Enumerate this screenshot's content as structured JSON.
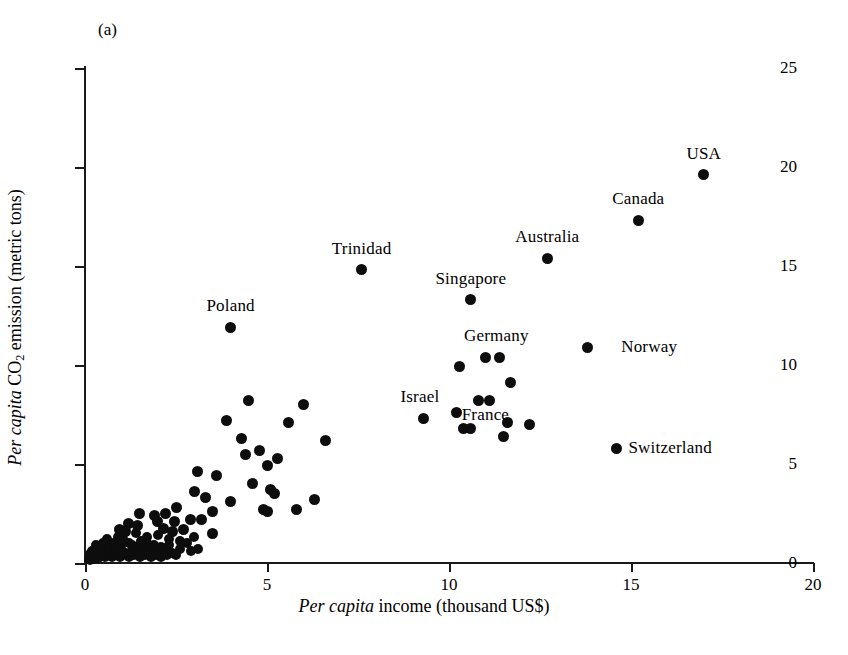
{
  "figure": {
    "panel_label": "(a)"
  },
  "chart_data": {
    "type": "scatter",
    "title": "",
    "panel": "(a)",
    "xlabel_parts": {
      "italic": "Per capita",
      "plain": " income (thousand US$)"
    },
    "ylabel_parts": {
      "italic": "Per capita",
      "plain_pre": " CO",
      "subscript": "2",
      "plain_post": " emission (metric tons)"
    },
    "xlabel": "Per capita income (thousand US$)",
    "ylabel": "Per capita CO2 emission (metric tons)",
    "xlim": [
      0,
      20
    ],
    "ylim": [
      0,
      25
    ],
    "xticks": [
      0,
      5,
      10,
      15,
      20
    ],
    "yticks": [
      0,
      5,
      10,
      15,
      20,
      25
    ],
    "xtick_labels": [
      "0",
      "5",
      "10",
      "15",
      "20"
    ],
    "ytick_labels": [
      "0",
      "5",
      "10",
      "15",
      "20",
      "25"
    ],
    "grid": false,
    "legend": false,
    "marker": {
      "shape": "circle",
      "color": "#0d0d0d",
      "size_px": 11
    },
    "annotations": [
      {
        "label": "USA",
        "x": 17.0,
        "y": 19.6,
        "position": "above"
      },
      {
        "label": "Canada",
        "x": 15.2,
        "y": 17.3,
        "position": "above"
      },
      {
        "label": "Australia",
        "x": 12.7,
        "y": 15.4,
        "position": "above"
      },
      {
        "label": "Trinidad",
        "x": 7.6,
        "y": 14.8,
        "position": "above"
      },
      {
        "label": "Singapore",
        "x": 10.6,
        "y": 13.3,
        "position": "above"
      },
      {
        "label": "Poland",
        "x": 4.0,
        "y": 11.9,
        "position": "above"
      },
      {
        "label": "Germany",
        "x": 11.3,
        "y": 10.4,
        "position": "above"
      },
      {
        "label": "Norway",
        "x": 14.4,
        "y": 10.9,
        "position": "right"
      },
      {
        "label": "Israel",
        "x": 9.2,
        "y": 7.3,
        "position": "above"
      },
      {
        "label": "France",
        "x": 11.0,
        "y": 6.4,
        "position": "above"
      },
      {
        "label": "Switzerland",
        "x": 14.6,
        "y": 5.8,
        "position": "right"
      }
    ],
    "labeled_points": [
      {
        "name": "USA",
        "x": 17.0,
        "y": 19.6
      },
      {
        "name": "Canada",
        "x": 15.2,
        "y": 17.3
      },
      {
        "name": "Australia",
        "x": 12.7,
        "y": 15.4
      },
      {
        "name": "Trinidad",
        "x": 7.6,
        "y": 14.8
      },
      {
        "name": "Singapore",
        "x": 10.6,
        "y": 13.3
      },
      {
        "name": "Poland",
        "x": 4.0,
        "y": 11.9
      },
      {
        "name": "Norway",
        "x": 13.8,
        "y": 10.9
      },
      {
        "name": "Germany",
        "x": 11.4,
        "y": 10.4
      },
      {
        "name": "Israel",
        "x": 9.3,
        "y": 7.3
      },
      {
        "name": "France",
        "x": 11.5,
        "y": 6.4
      },
      {
        "name": "Switzerland",
        "x": 14.6,
        "y": 5.8
      }
    ],
    "points": [
      [
        17.0,
        19.6
      ],
      [
        15.2,
        17.3
      ],
      [
        12.7,
        15.4
      ],
      [
        7.6,
        14.8
      ],
      [
        10.6,
        13.3
      ],
      [
        4.0,
        11.9
      ],
      [
        13.8,
        10.9
      ],
      [
        11.0,
        10.4
      ],
      [
        11.4,
        10.4
      ],
      [
        10.3,
        9.9
      ],
      [
        11.7,
        9.1
      ],
      [
        10.8,
        8.2
      ],
      [
        11.1,
        8.2
      ],
      [
        4.5,
        8.2
      ],
      [
        6.0,
        8.0
      ],
      [
        3.9,
        7.2
      ],
      [
        9.3,
        7.3
      ],
      [
        10.2,
        7.6
      ],
      [
        12.2,
        7.0
      ],
      [
        11.6,
        7.1
      ],
      [
        10.4,
        6.8
      ],
      [
        10.6,
        6.8
      ],
      [
        11.5,
        6.4
      ],
      [
        14.6,
        5.8
      ],
      [
        6.6,
        6.2
      ],
      [
        4.3,
        6.3
      ],
      [
        5.6,
        7.1
      ],
      [
        5.3,
        5.3
      ],
      [
        5.0,
        4.9
      ],
      [
        4.8,
        5.7
      ],
      [
        4.4,
        5.5
      ],
      [
        6.3,
        3.2
      ],
      [
        4.6,
        4.0
      ],
      [
        3.6,
        4.4
      ],
      [
        3.1,
        4.6
      ],
      [
        3.0,
        3.6
      ],
      [
        3.3,
        3.3
      ],
      [
        5.1,
        3.7
      ],
      [
        5.2,
        3.5
      ],
      [
        4.0,
        3.1
      ],
      [
        4.9,
        2.7
      ],
      [
        5.0,
        2.6
      ],
      [
        5.8,
        2.7
      ],
      [
        3.5,
        2.6
      ],
      [
        3.2,
        2.2
      ],
      [
        2.9,
        2.2
      ],
      [
        2.5,
        2.8
      ],
      [
        2.2,
        2.5
      ],
      [
        2.0,
        2.1
      ],
      [
        1.9,
        2.4
      ],
      [
        1.5,
        2.5
      ],
      [
        1.2,
        2.0
      ],
      [
        2.7,
        1.7
      ],
      [
        2.4,
        1.6
      ],
      [
        3.0,
        1.3
      ],
      [
        3.5,
        1.5
      ],
      [
        2.0,
        1.4
      ],
      [
        2.3,
        1.2
      ],
      [
        1.7,
        1.3
      ],
      [
        1.4,
        1.5
      ],
      [
        1.1,
        1.6
      ],
      [
        0.9,
        1.3
      ],
      [
        0.8,
        1.0
      ],
      [
        1.0,
        0.9
      ],
      [
        1.2,
        1.0
      ],
      [
        1.5,
        0.9
      ],
      [
        1.7,
        1.0
      ],
      [
        1.9,
        0.9
      ],
      [
        2.1,
        0.8
      ],
      [
        2.3,
        0.9
      ],
      [
        2.6,
        0.7
      ],
      [
        2.9,
        0.6
      ],
      [
        3.1,
        0.7
      ],
      [
        1.3,
        0.6
      ],
      [
        1.1,
        0.5
      ],
      [
        0.9,
        0.6
      ],
      [
        0.7,
        0.5
      ],
      [
        0.6,
        0.7
      ],
      [
        0.5,
        0.4
      ],
      [
        0.4,
        0.3
      ],
      [
        0.3,
        0.4
      ],
      [
        0.25,
        0.2
      ],
      [
        0.2,
        0.3
      ],
      [
        0.15,
        0.15
      ],
      [
        0.1,
        0.2
      ],
      [
        0.35,
        0.5
      ],
      [
        0.45,
        0.6
      ],
      [
        0.55,
        0.3
      ],
      [
        0.65,
        0.4
      ],
      [
        0.75,
        0.3
      ],
      [
        0.85,
        0.4
      ],
      [
        0.95,
        0.3
      ],
      [
        1.05,
        0.4
      ],
      [
        1.2,
        0.3
      ],
      [
        1.35,
        0.4
      ],
      [
        1.5,
        0.3
      ],
      [
        1.65,
        0.4
      ],
      [
        1.8,
        0.3
      ],
      [
        1.95,
        0.4
      ],
      [
        2.1,
        0.3
      ],
      [
        2.25,
        0.4
      ],
      [
        0.3,
        0.9
      ],
      [
        0.5,
        1.0
      ],
      [
        0.7,
        0.9
      ],
      [
        0.6,
        1.2
      ],
      [
        0.4,
        0.7
      ],
      [
        1.0,
        0.7
      ],
      [
        1.3,
        0.9
      ],
      [
        1.6,
        0.6
      ],
      [
        1.8,
        0.7
      ],
      [
        2.0,
        0.6
      ],
      [
        2.2,
        0.6
      ],
      [
        2.4,
        0.5
      ],
      [
        2.5,
        0.4
      ],
      [
        0.2,
        0.6
      ],
      [
        0.15,
        0.45
      ],
      [
        0.35,
        0.25
      ],
      [
        0.8,
        0.6
      ],
      [
        1.4,
        0.7
      ],
      [
        1.05,
        1.2
      ],
      [
        0.85,
        0.8
      ],
      [
        1.55,
        1.1
      ],
      [
        1.75,
        0.45
      ],
      [
        1.25,
        0.55
      ],
      [
        2.6,
        1.1
      ],
      [
        2.8,
        1.0
      ],
      [
        1.45,
        1.9
      ],
      [
        0.95,
        1.7
      ],
      [
        2.15,
        1.75
      ],
      [
        2.45,
        2.1
      ]
    ]
  }
}
